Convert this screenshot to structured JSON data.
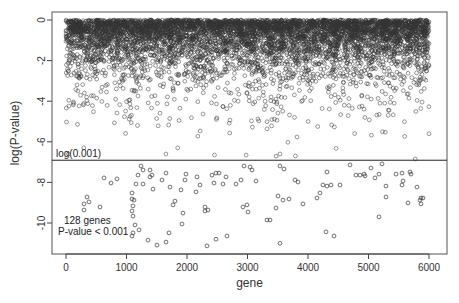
{
  "chart_data": {
    "type": "scatter",
    "title": "",
    "xlabel": "gene",
    "ylabel": "log(P-value)",
    "xlim": [
      -250,
      6250
    ],
    "ylim": [
      -11.5,
      0.3
    ],
    "x_ticks": [
      0,
      1000,
      2000,
      3000,
      4000,
      5000,
      6000
    ],
    "x_tick_labels": [
      "0",
      "1000",
      "2000",
      "3000",
      "4000",
      "5000",
      "6000"
    ],
    "y_ticks": [
      0,
      -2,
      -4,
      -6,
      -8,
      -10
    ],
    "y_tick_labels": [
      "0",
      "-2",
      "-4",
      "-6",
      "-8",
      "-10"
    ],
    "grid": false,
    "legend": null,
    "marker": "open-circle",
    "n_genes_total": 6000,
    "threshold": {
      "value": -6.9078,
      "label": "log(0.001)",
      "style": "horizontal-line"
    },
    "annotation": {
      "line1": "128 genes",
      "line2": "P-value < 0.001"
    },
    "distribution_note": "Points above the threshold form a dense cloud: log(P) ~ -Exponential(mean ~1.0), uniformly spread over genes 0-6000",
    "significant_points": [
      {
        "x": 347,
        "y": -8.72
      },
      {
        "x": 380,
        "y": -8.96
      },
      {
        "x": 298,
        "y": -9.06
      },
      {
        "x": 298,
        "y": -9.36
      },
      {
        "x": 562,
        "y": -9.21
      },
      {
        "x": 628,
        "y": -7.78
      },
      {
        "x": 744,
        "y": -8.03
      },
      {
        "x": 843,
        "y": -7.83
      },
      {
        "x": 1091,
        "y": -8.52
      },
      {
        "x": 1091,
        "y": -8.82
      },
      {
        "x": 1107,
        "y": -9.16
      },
      {
        "x": 1091,
        "y": -9.41
      },
      {
        "x": 1124,
        "y": -8.87
      },
      {
        "x": 1107,
        "y": -9.66
      },
      {
        "x": 1140,
        "y": -10.1
      },
      {
        "x": 1107,
        "y": -10.49
      },
      {
        "x": 1091,
        "y": -10.64
      },
      {
        "x": 1157,
        "y": -8.08
      },
      {
        "x": 1273,
        "y": -8.08
      },
      {
        "x": 1190,
        "y": -7.64
      },
      {
        "x": 1240,
        "y": -7.19
      },
      {
        "x": 1273,
        "y": -7.39
      },
      {
        "x": 1388,
        "y": -7.39
      },
      {
        "x": 1388,
        "y": -7.73
      },
      {
        "x": 1421,
        "y": -7.64
      },
      {
        "x": 1438,
        "y": -8.33
      },
      {
        "x": 1587,
        "y": -7.88
      },
      {
        "x": 1653,
        "y": -7.54
      },
      {
        "x": 1719,
        "y": -8.23
      },
      {
        "x": 1769,
        "y": -9.11
      },
      {
        "x": 1802,
        "y": -8.92
      },
      {
        "x": 1901,
        "y": -8.37
      },
      {
        "x": 1917,
        "y": -10.05
      },
      {
        "x": 1934,
        "y": -9.51
      },
      {
        "x": 1983,
        "y": -7.59
      },
      {
        "x": 1967,
        "y": -7.88
      },
      {
        "x": 2149,
        "y": -8.47
      },
      {
        "x": 2165,
        "y": -7.73
      },
      {
        "x": 2215,
        "y": -8.13
      },
      {
        "x": 2298,
        "y": -9.21
      },
      {
        "x": 2347,
        "y": -9.36
      },
      {
        "x": 2298,
        "y": -9.41
      },
      {
        "x": 2413,
        "y": -7.64
      },
      {
        "x": 2446,
        "y": -8.03
      },
      {
        "x": 2479,
        "y": -7.54
      },
      {
        "x": 2529,
        "y": -7.54
      },
      {
        "x": 2595,
        "y": -8.08
      },
      {
        "x": 2645,
        "y": -7.73
      },
      {
        "x": 2810,
        "y": -8.08
      },
      {
        "x": 2926,
        "y": -9.21
      },
      {
        "x": 2992,
        "y": -9.11
      },
      {
        "x": 3008,
        "y": -9.46
      },
      {
        "x": 2893,
        "y": -7.88
      },
      {
        "x": 2942,
        "y": -7.19
      },
      {
        "x": 2661,
        "y": -10.64
      },
      {
        "x": 2331,
        "y": -11.13
      },
      {
        "x": 1504,
        "y": -11.09
      },
      {
        "x": 1355,
        "y": -10.84
      },
      {
        "x": 1207,
        "y": -10.34
      },
      {
        "x": 1653,
        "y": -10.94
      },
      {
        "x": 1702,
        "y": -10.49
      },
      {
        "x": 3041,
        "y": -7.24
      },
      {
        "x": 3074,
        "y": -7.39
      },
      {
        "x": 3140,
        "y": -7.93
      },
      {
        "x": 3537,
        "y": -7.19
      },
      {
        "x": 3603,
        "y": -7.34
      },
      {
        "x": 3785,
        "y": -7.88
      },
      {
        "x": 3835,
        "y": -7.98
      },
      {
        "x": 3686,
        "y": -8.82
      },
      {
        "x": 3587,
        "y": -8.87
      },
      {
        "x": 3504,
        "y": -8.67
      },
      {
        "x": 3471,
        "y": -9.26
      },
      {
        "x": 3917,
        "y": -9.06
      },
      {
        "x": 4149,
        "y": -8.77
      },
      {
        "x": 4198,
        "y": -8.52
      },
      {
        "x": 4248,
        "y": -8.13
      },
      {
        "x": 4314,
        "y": -8.18
      },
      {
        "x": 4314,
        "y": -7.49
      },
      {
        "x": 4380,
        "y": -8.13
      },
      {
        "x": 4529,
        "y": -8.13
      },
      {
        "x": 4430,
        "y": -10.64
      },
      {
        "x": 4298,
        "y": -10.44
      },
      {
        "x": 4694,
        "y": -7.14
      },
      {
        "x": 4793,
        "y": -7.64
      },
      {
        "x": 4860,
        "y": -7.64
      },
      {
        "x": 4926,
        "y": -7.59
      },
      {
        "x": 4942,
        "y": -7.68
      },
      {
        "x": 5041,
        "y": -7.29
      },
      {
        "x": 5107,
        "y": -7.78
      },
      {
        "x": 5174,
        "y": -7.59
      },
      {
        "x": 5223,
        "y": -7.09
      },
      {
        "x": 5289,
        "y": -8.18
      },
      {
        "x": 5289,
        "y": -8.72
      },
      {
        "x": 5174,
        "y": -9.7
      },
      {
        "x": 5455,
        "y": -7.59
      },
      {
        "x": 5554,
        "y": -7.54
      },
      {
        "x": 5702,
        "y": -7.59
      },
      {
        "x": 5554,
        "y": -8.13
      },
      {
        "x": 5570,
        "y": -7.93
      },
      {
        "x": 5686,
        "y": -7.49
      },
      {
        "x": 5653,
        "y": -9.01
      },
      {
        "x": 5851,
        "y": -8.87
      },
      {
        "x": 5868,
        "y": -8.77
      },
      {
        "x": 5868,
        "y": -9.06
      },
      {
        "x": 5802,
        "y": -8.23
      },
      {
        "x": 5901,
        "y": -8.77
      },
      {
        "x": 3537,
        "y": -11.0
      },
      {
        "x": 3372,
        "y": -9.85
      },
      {
        "x": 3322,
        "y": -9.85
      },
      {
        "x": 2479,
        "y": -10.8
      }
    ]
  },
  "frame": {
    "plot_left": 52,
    "plot_top": 12,
    "plot_right": 447,
    "plot_bottom": 254,
    "x0_px": 66,
    "x_px_per_unit": 0.0605,
    "y0_px": 20,
    "y_px_per_unit": 20.3
  },
  "colors": {
    "marker": "#333333",
    "axis": "#444444",
    "threshold_line": "#222222",
    "background": "#ffffff"
  }
}
